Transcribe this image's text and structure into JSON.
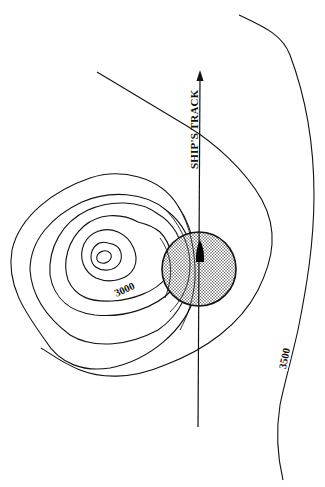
{
  "figure": {
    "type": "bathymetric contour diagram",
    "track_label": "SHIP'S TRACK",
    "contour_labels": {
      "inner": "3000",
      "outer": "3500"
    },
    "colors": {
      "line": "#111111",
      "background": "#ffffff",
      "ship": "#000000",
      "footprint_fill": "#bdbdbd"
    }
  }
}
